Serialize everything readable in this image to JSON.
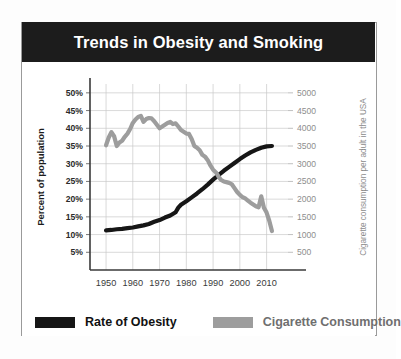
{
  "title": "Trends in Obesity and Smoking",
  "legend": {
    "items": [
      {
        "label": "Rate of Obesity",
        "color": "#161616",
        "swatch_name": "legend-swatch-obesity"
      },
      {
        "label": "Cigarette Consumption",
        "color": "#9d9d9d",
        "swatch_name": "legend-swatch-cigarette"
      }
    ]
  },
  "chart_data": {
    "type": "line",
    "title": "Trends in Obesity and Smoking",
    "xlabel": "",
    "ylabel": "Percent of population",
    "y2label": "Cigarette consumption per adult in the USA",
    "xlim": [
      1944,
      2018
    ],
    "ylim": [
      0,
      52.5
    ],
    "y2lim": [
      0,
      5250
    ],
    "grid": true,
    "legend_position": "bottom",
    "xticks": [
      1950,
      1960,
      1970,
      1980,
      1990,
      2000,
      2010
    ],
    "xtick_labels": [
      "1950",
      "1960",
      "1970",
      "1980",
      "1990",
      "2000",
      "2010"
    ],
    "yticks": [
      5,
      10,
      15,
      20,
      25,
      30,
      35,
      40,
      45,
      50
    ],
    "ytick_labels": [
      "5%",
      "10%",
      "15%",
      "20%",
      "25%",
      "30%",
      "35%",
      "40%",
      "45%",
      "50%"
    ],
    "y2ticks": [
      500,
      1000,
      1500,
      2000,
      2500,
      3000,
      3500,
      4000,
      4500,
      5000
    ],
    "y2tick_labels": [
      "500",
      "1000",
      "1500",
      "2000",
      "2500",
      "3000",
      "3500",
      "4000",
      "4500",
      "5000"
    ],
    "series": [
      {
        "name": "Rate of Obesity",
        "axis": "left",
        "color": "#161616",
        "units": "percent of population",
        "x": [
          1950,
          1952,
          1954,
          1956,
          1958,
          1960,
          1962,
          1964,
          1966,
          1968,
          1970,
          1972,
          1974,
          1976,
          1977,
          1978,
          1980,
          1982,
          1984,
          1986,
          1988,
          1990,
          1992,
          1994,
          1996,
          1998,
          2000,
          2002,
          2004,
          2006,
          2008,
          2010,
          2012
        ],
        "y": [
          11.2,
          11.3,
          11.5,
          11.6,
          11.8,
          12.0,
          12.3,
          12.6,
          13.0,
          13.6,
          14.1,
          14.8,
          15.4,
          16.3,
          17.6,
          18.4,
          19.4,
          20.5,
          21.6,
          22.8,
          24.1,
          25.5,
          26.8,
          28.0,
          29.1,
          30.2,
          31.3,
          32.3,
          33.2,
          33.9,
          34.5,
          34.9,
          35.0
        ]
      },
      {
        "name": "Cigarette Consumption",
        "axis": "right",
        "color": "#9d9d9d",
        "units": "cigarettes per adult in the USA",
        "x": [
          1950,
          1951,
          1952,
          1953,
          1954,
          1955,
          1956,
          1957,
          1958,
          1959,
          1960,
          1961,
          1962,
          1963,
          1964,
          1965,
          1966,
          1967,
          1968,
          1969,
          1970,
          1971,
          1972,
          1973,
          1974,
          1975,
          1976,
          1977,
          1978,
          1979,
          1980,
          1981,
          1982,
          1983,
          1984,
          1985,
          1986,
          1987,
          1988,
          1989,
          1990,
          1991,
          1992,
          1993,
          1994,
          1995,
          1996,
          1997,
          1998,
          1999,
          2000,
          2001,
          2002,
          2003,
          2004,
          2005,
          2006,
          2007,
          2008,
          2009,
          2010,
          2011,
          2012
        ],
        "y": [
          3520,
          3740,
          3890,
          3780,
          3500,
          3600,
          3650,
          3760,
          3850,
          3980,
          4150,
          4250,
          4320,
          4350,
          4180,
          4260,
          4290,
          4280,
          4200,
          4100,
          4000,
          4050,
          4100,
          4150,
          4180,
          4120,
          4140,
          4050,
          3950,
          3900,
          3850,
          3840,
          3700,
          3500,
          3450,
          3380,
          3250,
          3200,
          3100,
          2950,
          2830,
          2760,
          2640,
          2540,
          2500,
          2480,
          2460,
          2420,
          2310,
          2200,
          2120,
          2060,
          2020,
          1960,
          1900,
          1850,
          1800,
          1770,
          2080,
          1760,
          1620,
          1390,
          1100
        ]
      }
    ],
    "annotations": [
      {
        "text": "lines cross near 1991 at ~27% obesity / ~2760 cigarettes",
        "x": 1991,
        "y": 27
      }
    ]
  }
}
